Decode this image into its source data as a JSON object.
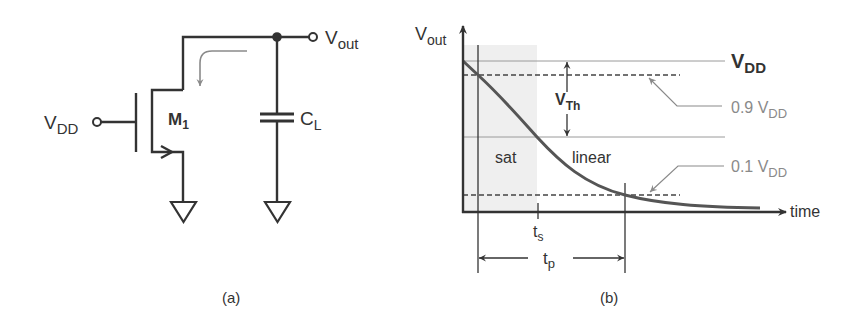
{
  "figure_a": {
    "caption": "(a)",
    "input_label": "V",
    "input_sub": "DD",
    "output_label": "V",
    "output_sub": "out",
    "transistor_label": "M",
    "transistor_sub": "1",
    "capacitor_label": "C",
    "capacitor_sub": "L"
  },
  "figure_b": {
    "caption": "(b)",
    "y_axis_label": "V",
    "y_axis_sub": "out",
    "x_axis_label": "time",
    "vdd_label": "V",
    "vdd_sub": "DD",
    "vth_label": "V",
    "vth_sub": "Th",
    "level_90_label": "0.9 V",
    "level_90_sub": "DD",
    "level_10_label": "0.1 V",
    "level_10_sub": "DD",
    "region_sat": "sat",
    "region_linear": "linear",
    "ts_label": "t",
    "ts_sub": "s",
    "tp_label": "t",
    "tp_sub": "p"
  },
  "colors": {
    "stroke": "#333333",
    "annotation": "#8a8a8a",
    "shade": "#efefef",
    "grid": "#9a9a9a"
  }
}
